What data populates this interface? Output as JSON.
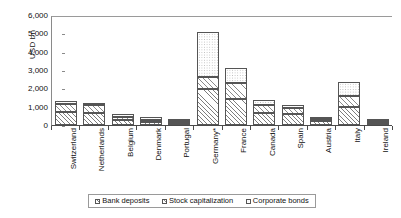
{
  "chart_data": {
    "type": "bar",
    "subtype": "stacked-vertical",
    "title": "",
    "xlabel": "",
    "ylabel": "USD bn",
    "ylim": [
      0,
      6000
    ],
    "ytick_step": 1000,
    "ytick_labels": [
      "6,000",
      "5,000",
      "4,000",
      "3,000",
      "2,000",
      "1,000",
      "0"
    ],
    "ytick_values": [
      6000,
      5000,
      4000,
      3000,
      2000,
      1000,
      0
    ],
    "grid": false,
    "legend_position": "bottom",
    "categories": [
      "Switzerland",
      "Netherlands",
      "Belgium",
      "Denmark",
      "Portugal",
      "Germany*",
      "France",
      "Canada",
      "Spain",
      "Austria",
      "Italy",
      "Ireland"
    ],
    "series": [
      {
        "name": "Bank deposits",
        "swatch": "deposits",
        "values": [
          720,
          640,
          260,
          140,
          130,
          1950,
          1400,
          640,
          620,
          200,
          1000,
          80
        ]
      },
      {
        "name": "Stock capitalization",
        "swatch": "stock",
        "values": [
          420,
          430,
          180,
          140,
          60,
          650,
          900,
          440,
          330,
          90,
          600,
          30
        ]
      },
      {
        "name": "Corporate bonds",
        "swatch": "bonds",
        "values": [
          190,
          150,
          160,
          140,
          60,
          2500,
          800,
          270,
          150,
          60,
          750,
          40
        ]
      }
    ],
    "totals": [
      1330,
      1220,
      600,
      420,
      250,
      5100,
      3100,
      1350,
      1100,
      350,
      2350,
      150
    ]
  },
  "legend": {
    "items": [
      {
        "label": "Bank deposits"
      },
      {
        "label": "Stock capitalization"
      },
      {
        "label": "Corporate bonds"
      }
    ]
  }
}
